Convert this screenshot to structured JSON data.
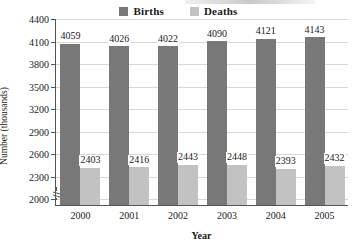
{
  "legend": {
    "items": [
      {
        "label": "Births",
        "color": "#787878",
        "key": "births"
      },
      {
        "label": "Deaths",
        "color": "#c2c2c2",
        "key": "deaths"
      }
    ]
  },
  "axes": {
    "ylabel": "Number (thousands)",
    "xlabel": "Year",
    "yticks": [
      "4400",
      "4100",
      "3800",
      "3500",
      "3200",
      "2900",
      "2600",
      "2300",
      "2000"
    ]
  },
  "chart_data": {
    "type": "bar",
    "title": "",
    "xlabel": "Year",
    "ylabel": "Number (thousands)",
    "categories": [
      "2000",
      "2001",
      "2002",
      "2003",
      "2004",
      "2005"
    ],
    "series": [
      {
        "name": "Births",
        "color": "#787878",
        "values": [
          4059,
          4026,
          4022,
          4090,
          4121,
          4143
        ]
      },
      {
        "name": "Deaths",
        "color": "#c2c2c2",
        "values": [
          2403,
          2416,
          2443,
          2448,
          2393,
          2432
        ]
      }
    ],
    "ylim": [
      1910,
      4400
    ],
    "ytick_values": [
      4400,
      4100,
      3800,
      3500,
      3200,
      2900,
      2600,
      2300,
      2000
    ],
    "y_axis_break": true,
    "grid": "horizontal",
    "legend_position": "top-center"
  }
}
